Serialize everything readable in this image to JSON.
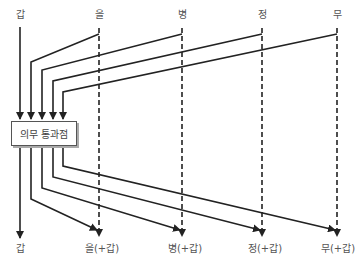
{
  "diagram": {
    "top_labels": [
      "갑",
      "을",
      "병",
      "정",
      "무"
    ],
    "bottom_labels": [
      "갑",
      "을(+갑)",
      "병(+갑)",
      "정(+갑)",
      "무(+갑)"
    ],
    "box_label": "의무 통과점",
    "colors": {
      "line": "#222222",
      "text": "#555555",
      "box_border": "#555555"
    }
  }
}
